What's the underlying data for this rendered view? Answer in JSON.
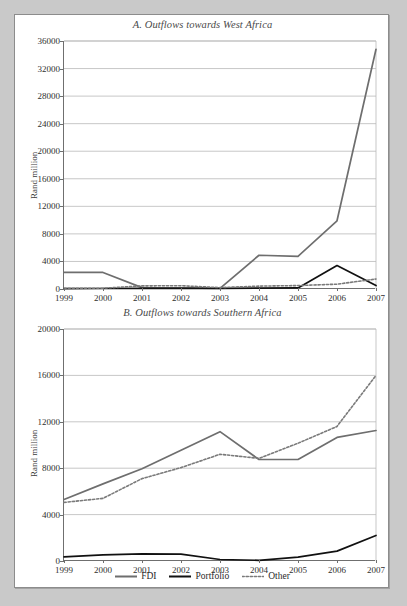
{
  "figure": {
    "background": "#c9c9c9",
    "paper": "#ffffff"
  },
  "legend": {
    "position": "bottom-center",
    "items": [
      {
        "label": "FDI",
        "style": "solid",
        "color": "#6e6e6e"
      },
      {
        "label": "Portfolio",
        "style": "solid",
        "color": "#111111"
      },
      {
        "label": "Other",
        "style": "dotted",
        "color": "#7a7a7a"
      }
    ]
  },
  "chart_data": [
    {
      "type": "line",
      "title": "A. Outflows towards West Africa",
      "xlabel": "",
      "ylabel": "Rand million",
      "x": [
        1999,
        2000,
        2001,
        2002,
        2003,
        2004,
        2005,
        2006,
        2007
      ],
      "xticklabels": [
        "1999",
        "2000",
        "2001",
        "2002",
        "2003",
        "2004",
        "2005",
        "2006",
        "2007"
      ],
      "yticklabels": [
        "0",
        "4000",
        "8000",
        "12000",
        "16000",
        "20000",
        "24000",
        "28000",
        "32000",
        "36000"
      ],
      "yticks": [
        0,
        4000,
        8000,
        12000,
        16000,
        20000,
        24000,
        28000,
        32000,
        36000
      ],
      "ylim": [
        0,
        36000
      ],
      "grid": "horizontal",
      "series": [
        {
          "name": "FDI",
          "color": "#6e6e6e",
          "style": "solid",
          "values": [
            2400,
            2400,
            200,
            150,
            100,
            4900,
            4750,
            9900,
            34800
          ]
        },
        {
          "name": "Portfolio",
          "color": "#111111",
          "style": "solid",
          "values": [
            60,
            70,
            80,
            90,
            100,
            120,
            150,
            3400,
            500
          ]
        },
        {
          "name": "Other",
          "color": "#7a7a7a",
          "style": "dotted",
          "values": [
            100,
            120,
            450,
            480,
            200,
            420,
            500,
            700,
            1450
          ]
        }
      ]
    },
    {
      "type": "line",
      "title": "B. Outflows towards Southern Africa",
      "xlabel": "",
      "ylabel": "Rand million",
      "x": [
        1999,
        2000,
        2001,
        2002,
        2003,
        2004,
        2005,
        2006,
        2007
      ],
      "xticklabels": [
        "1999",
        "2000",
        "2001",
        "2002",
        "2003",
        "2004",
        "2005",
        "2006",
        "2007"
      ],
      "yticklabels": [
        "0",
        "4000",
        "8000",
        "12000",
        "16000",
        "20000"
      ],
      "yticks": [
        0,
        4000,
        8000,
        12000,
        16000,
        20000
      ],
      "ylim": [
        0,
        20000
      ],
      "grid": "horizontal",
      "series": [
        {
          "name": "FDI",
          "color": "#6e6e6e",
          "style": "solid",
          "values": [
            5300,
            6650,
            7950,
            9550,
            11150,
            8750,
            8750,
            10650,
            11250
          ]
        },
        {
          "name": "Portfolio",
          "color": "#111111",
          "style": "solid",
          "values": [
            350,
            520,
            620,
            600,
            130,
            60,
            330,
            850,
            2200
          ]
        },
        {
          "name": "Other",
          "color": "#7a7a7a",
          "style": "dotted",
          "values": [
            5050,
            5400,
            7100,
            8050,
            9200,
            8850,
            10150,
            11600,
            16000
          ]
        }
      ]
    }
  ]
}
